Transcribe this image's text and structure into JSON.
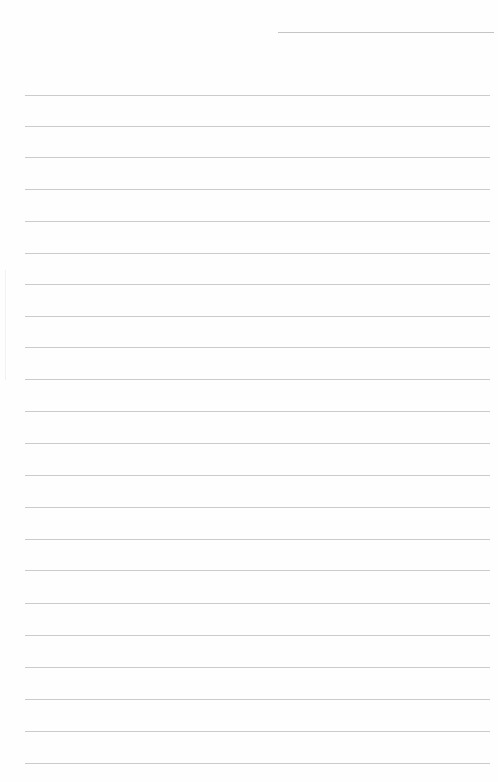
{
  "document": {
    "type": "ruled-notebook-page",
    "colors": {
      "paper": "#fefefe",
      "rule": "#cbcbcb",
      "header_line": "#c4c4c4"
    },
    "header_line": {
      "x1": 278,
      "x2": 494,
      "y": 32
    },
    "rules": {
      "x1": 25,
      "x2": 490,
      "y_positions": [
        95,
        126,
        157,
        189,
        221,
        253,
        284,
        316,
        347,
        379,
        411,
        443,
        475,
        507,
        539,
        570,
        603,
        635,
        667,
        699,
        731,
        763
      ]
    },
    "text_content": []
  }
}
